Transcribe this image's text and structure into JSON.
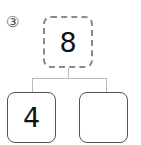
{
  "problem": {
    "number_label": "③",
    "whole": "8",
    "parts": [
      "4",
      ""
    ]
  }
}
